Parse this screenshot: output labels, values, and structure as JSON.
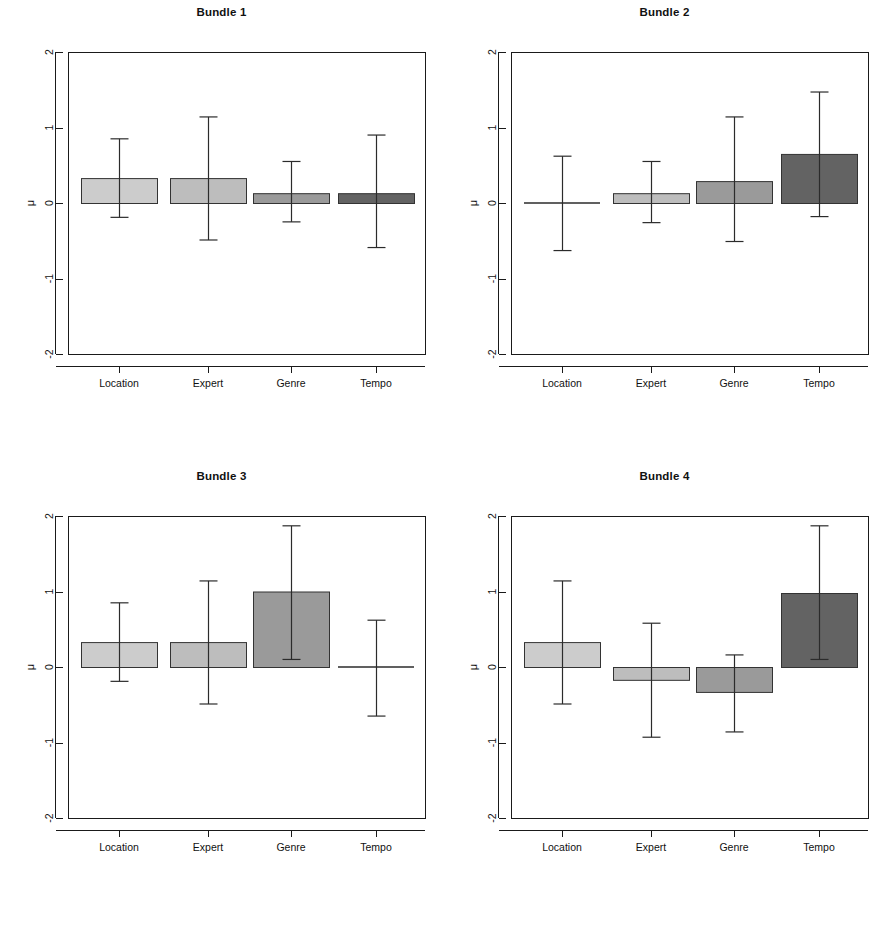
{
  "figure": {
    "width": 886,
    "height": 928,
    "background": "#ffffff"
  },
  "axis": {
    "ylabel": "μ",
    "ytick_labels": [
      "2",
      "1",
      "0",
      "-1",
      "-2"
    ],
    "ytick_values": [
      2,
      1,
      0,
      -1,
      -2
    ],
    "ylim": [
      -2,
      2
    ],
    "categories": [
      "Location",
      "Expert",
      "Genre",
      "Tempo"
    ]
  },
  "colors": {
    "bar_location": "#cccccc",
    "bar_expert": "#bdbdbd",
    "bar_genre": "#9a9a9a",
    "bar_tempo": "#636363",
    "bar_border": "#333333",
    "axis": "#1a1a1a",
    "error_bar": "#2b2b2b"
  },
  "chart_data": [
    {
      "type": "bar",
      "title": "Bundle 1",
      "xlabel": "",
      "ylabel": "μ",
      "ylim": [
        -2,
        2
      ],
      "grid": false,
      "legend": "none",
      "categories": [
        "Location",
        "Expert",
        "Genre",
        "Tempo"
      ],
      "values": [
        0.33,
        0.33,
        0.13,
        0.13
      ],
      "error_low": [
        -0.19,
        -0.49,
        -0.25,
        -0.59
      ],
      "error_high": [
        0.85,
        1.14,
        0.55,
        0.9
      ]
    },
    {
      "type": "bar",
      "title": "Bundle 2",
      "xlabel": "",
      "ylabel": "μ",
      "ylim": [
        -2,
        2
      ],
      "grid": false,
      "legend": "none",
      "categories": [
        "Location",
        "Expert",
        "Genre",
        "Tempo"
      ],
      "values": [
        0.0,
        0.13,
        0.29,
        0.65
      ],
      "error_low": [
        -0.63,
        -0.26,
        -0.51,
        -0.18
      ],
      "error_high": [
        0.62,
        0.55,
        1.14,
        1.47
      ]
    },
    {
      "type": "bar",
      "title": "Bundle 3",
      "xlabel": "",
      "ylabel": "μ",
      "ylim": [
        -2,
        2
      ],
      "grid": false,
      "legend": "none",
      "categories": [
        "Location",
        "Expert",
        "Genre",
        "Tempo"
      ],
      "values": [
        0.33,
        0.33,
        1.0,
        0.0
      ],
      "error_low": [
        -0.19,
        -0.49,
        0.1,
        -0.65
      ],
      "error_high": [
        0.85,
        1.14,
        1.87,
        0.62
      ]
    },
    {
      "type": "bar",
      "title": "Bundle 4",
      "xlabel": "",
      "ylabel": "μ",
      "ylim": [
        -2,
        2
      ],
      "grid": false,
      "legend": "none",
      "categories": [
        "Location",
        "Expert",
        "Genre",
        "Tempo"
      ],
      "values": [
        0.33,
        -0.17,
        -0.33,
        0.98
      ],
      "error_low": [
        -0.49,
        -0.93,
        -0.86,
        0.1
      ],
      "error_high": [
        1.14,
        0.58,
        0.16,
        1.87
      ]
    }
  ]
}
